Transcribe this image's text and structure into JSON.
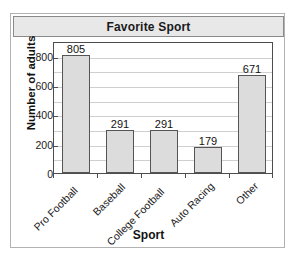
{
  "chart_data": {
    "type": "bar",
    "title": "Favorite Sport",
    "xlabel": "Sport",
    "ylabel": "Number of adults",
    "categories": [
      "Pro Football",
      "Baseball",
      "College Football",
      "Auto Racing",
      "Other"
    ],
    "values": [
      805,
      291,
      291,
      179,
      671
    ],
    "value_labels": [
      "805",
      "291",
      "291",
      "179",
      "671"
    ],
    "ylim": [
      0,
      900
    ],
    "ytick_labels": [
      "0",
      "200",
      "400",
      "600",
      "800"
    ],
    "ytick_values": [
      0,
      200,
      400,
      600,
      800
    ],
    "gridline_values": [
      100,
      200,
      300,
      400,
      500,
      600,
      700,
      800
    ],
    "grid": true,
    "legend": "none",
    "bar_fill_color": "#dcdcdc",
    "bar_border_color": "#555555",
    "gridline_color": "#cfcfcf",
    "axis_color": "#4d4d4d",
    "title_bar_color": "#e8e8e8",
    "card_border_color": "#b2b2b2"
  }
}
